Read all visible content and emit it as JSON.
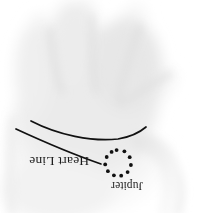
{
  "figure": {
    "kind": "palmistry-diagram",
    "orientation": "labels-rotated-180",
    "background_color": "#ffffff",
    "ink_color": "#111111",
    "skin_tint": "#e8e8e8",
    "width": 213,
    "height": 213
  },
  "labels": [
    {
      "id": "heart-line",
      "text": "Heart Line",
      "x": 29,
      "y": 154,
      "font_size": 13.5,
      "rotation": 180,
      "color": "#1a1a1a"
    },
    {
      "id": "jupiter",
      "text": "Jupiter",
      "x": 111,
      "y": 179,
      "font_size": 11.5,
      "rotation": 180,
      "color": "#1a1a1a"
    }
  ],
  "lines": [
    {
      "id": "heart-line-curve",
      "name": "heart-line-stroke",
      "path": "M 31,121 C 58,135 92,142 118,139 C 130,137 139,133 146,127",
      "stroke": "#111111",
      "stroke_width": 1.7
    },
    {
      "id": "jupiter-branch",
      "name": "jupiter-branch-stroke",
      "path": "M 16,129 C 42,141 72,154 101,164",
      "stroke": "#111111",
      "stroke_width": 1.7
    }
  ],
  "marking": {
    "id": "jupiter-ring",
    "name": "ring-of-dots",
    "shape": "circle-of-dots",
    "dot_count": 11,
    "center_x": 118,
    "center_y": 163,
    "radius": 13,
    "dot_radius": 1.9,
    "color": "#111111",
    "start_angle_deg": -96,
    "dots": [
      {
        "index": 0,
        "cx": 116.6,
        "cy": 150.1
      },
      {
        "index": 1,
        "cx": 124.4,
        "cy": 151.3
      },
      {
        "index": 2,
        "cx": 129.7,
        "cy": 157.2
      },
      {
        "index": 3,
        "cx": 130.9,
        "cy": 165.0
      },
      {
        "index": 4,
        "cx": 127.6,
        "cy": 172.1
      },
      {
        "index": 5,
        "cx": 121.2,
        "cy": 175.7
      },
      {
        "index": 6,
        "cx": 113.9,
        "cy": 175.3
      },
      {
        "index": 7,
        "cx": 107.9,
        "cy": 171.2
      },
      {
        "index": 8,
        "cx": 105.2,
        "cy": 164.4
      },
      {
        "index": 9,
        "cx": 106.7,
        "cy": 157.0
      },
      {
        "index": 10,
        "cx": 111.6,
        "cy": 151.9
      }
    ]
  },
  "hand": {
    "name": "palm-photo",
    "description": "faint grayscale palm with fingers at top and index finger lower-right",
    "regions": [
      {
        "id": "palm-mass",
        "cx": 95,
        "cy": 95,
        "rx": 72,
        "ry": 78,
        "tint": "#ededed"
      },
      {
        "id": "thumb-web",
        "cx": 128,
        "cy": 62,
        "rx": 40,
        "ry": 52,
        "tint": "#eaeaea"
      },
      {
        "id": "middle-ridge",
        "cx": 72,
        "cy": 40,
        "rx": 26,
        "ry": 44,
        "tint": "#ededed"
      },
      {
        "id": "ring-ridge",
        "cx": 30,
        "cy": 70,
        "rx": 20,
        "ry": 50,
        "tint": "#efefef"
      },
      {
        "id": "index-finger",
        "cx": 172,
        "cy": 150,
        "rx": 20,
        "ry": 38,
        "tint": "#ebebeb"
      },
      {
        "id": "lower-palm",
        "cx": 60,
        "cy": 185,
        "rx": 58,
        "ry": 34,
        "tint": "#f1f1f1"
      }
    ]
  }
}
